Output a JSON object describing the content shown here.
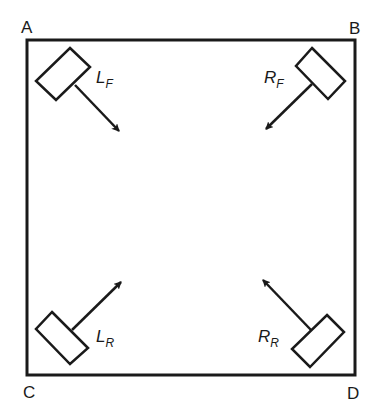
{
  "diagram": {
    "corners": {
      "A": "A",
      "B": "B",
      "C": "C",
      "D": "D"
    },
    "wheels": [
      {
        "id": "left-front",
        "label_main": "L",
        "label_sub": "F"
      },
      {
        "id": "right-front",
        "label_main": "R",
        "label_sub": "F"
      },
      {
        "id": "left-rear",
        "label_main": "L",
        "label_sub": "R"
      },
      {
        "id": "right-rear",
        "label_main": "R",
        "label_sub": "R"
      }
    ],
    "colors": {
      "line": "#1a1a1a",
      "background": "#ffffff"
    }
  }
}
